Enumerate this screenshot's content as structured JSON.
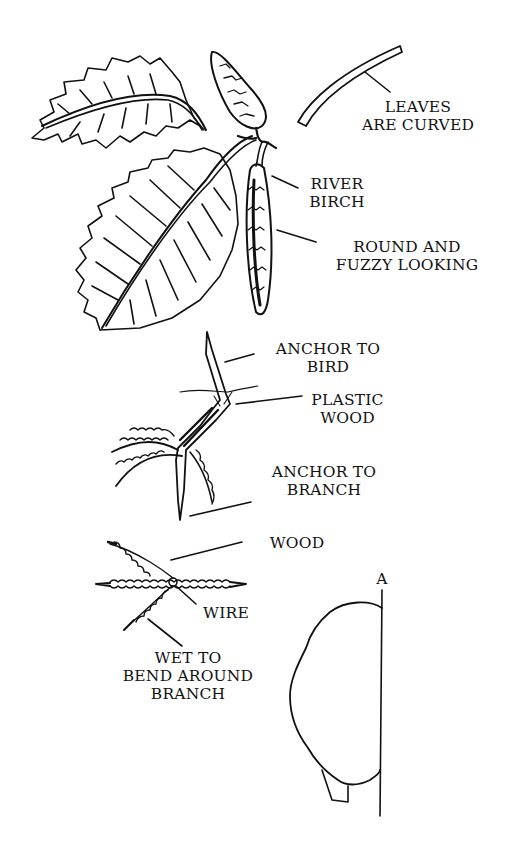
{
  "colors": {
    "ink": "#111111",
    "background": "#ffffff"
  },
  "labels": {
    "leaves_curved": [
      "LEAVES",
      "ARE CURVED"
    ],
    "river_birch": [
      "RIVER",
      "BIRCH"
    ],
    "round_fuzzy": [
      "ROUND AND",
      "FUZZY LOOKING"
    ],
    "anchor_bird": [
      "ANCHOR TO",
      "BIRD"
    ],
    "plastic_wood": [
      "PLASTIC",
      "WOOD"
    ],
    "anchor_branch": [
      "ANCHOR TO",
      "BRANCH"
    ],
    "wood": [
      "WOOD"
    ],
    "wire": [
      "WIRE"
    ],
    "wet_bend": [
      "WET TO",
      "BEND AROUND",
      "BRANCH"
    ],
    "a_marker": [
      "A"
    ]
  },
  "icons": {
    "upper_leaf": "serrated-leaf",
    "lower_leaf": "serrated-leaf",
    "cone": "birch-cone",
    "catkin": "birch-catkin",
    "curved_leaf_section": "curved-leaf-profile",
    "foot_assembly": "bird-foot-side",
    "foot_top": "bird-foot-top",
    "profile": "body-profile-outline"
  }
}
